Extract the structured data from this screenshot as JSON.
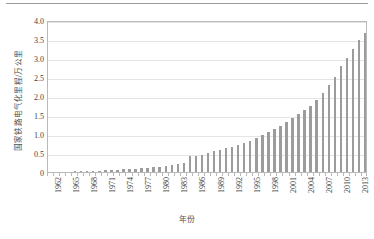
{
  "chart_data": {
    "type": "bar",
    "title": "",
    "xlabel": "年份",
    "ylabel": "国家铁路电气化里程/万公里",
    "ylim": [
      0,
      4.0
    ],
    "grid": true,
    "legend": "none",
    "bar_color": "#9c9c9c",
    "plot_border_color": "#b9b9b9",
    "gridline_color": "#e4e4e4",
    "ytick_labels": [
      "4.0",
      "3.5",
      "3.0",
      "2.5",
      "2.0",
      "1.5",
      "1.0",
      "0.5",
      "0"
    ],
    "ytick_values": [
      4.0,
      3.5,
      3.0,
      2.5,
      2.0,
      1.5,
      1.0,
      0.5,
      0
    ],
    "xtick_labels": [
      "1962",
      "1965",
      "1968",
      "1971",
      "1974",
      "1977",
      "1980",
      "1983",
      "1986",
      "1989",
      "1992",
      "1995",
      "1998",
      "2001",
      "2004",
      "2007",
      "2010",
      "2013"
    ],
    "categories": [
      "1962",
      "1963",
      "1964",
      "1965",
      "1966",
      "1967",
      "1968",
      "1969",
      "1970",
      "1971",
      "1972",
      "1973",
      "1974",
      "1975",
      "1976",
      "1977",
      "1978",
      "1979",
      "1980",
      "1981",
      "1982",
      "1983",
      "1984",
      "1985",
      "1986",
      "1987",
      "1988",
      "1989",
      "1990",
      "1991",
      "1992",
      "1993",
      "1994",
      "1995",
      "1996",
      "1997",
      "1998",
      "1999",
      "2000",
      "2001",
      "2002",
      "2003",
      "2004",
      "2005",
      "2006",
      "2007",
      "2008",
      "2009",
      "2010",
      "2011",
      "2012",
      "2013",
      "2014"
    ],
    "values": [
      0.01,
      0.01,
      0.01,
      0.01,
      0.02,
      0.02,
      0.02,
      0.03,
      0.03,
      0.04,
      0.05,
      0.06,
      0.07,
      0.08,
      0.09,
      0.1,
      0.11,
      0.13,
      0.14,
      0.16,
      0.18,
      0.2,
      0.23,
      0.41,
      0.43,
      0.46,
      0.5,
      0.55,
      0.58,
      0.62,
      0.66,
      0.72,
      0.77,
      0.82,
      0.9,
      0.97,
      1.05,
      1.13,
      1.22,
      1.31,
      1.42,
      1.52,
      1.62,
      1.75,
      1.9,
      2.08,
      2.28,
      2.51,
      2.78,
      3.0,
      3.25,
      3.48,
      3.65
    ]
  }
}
